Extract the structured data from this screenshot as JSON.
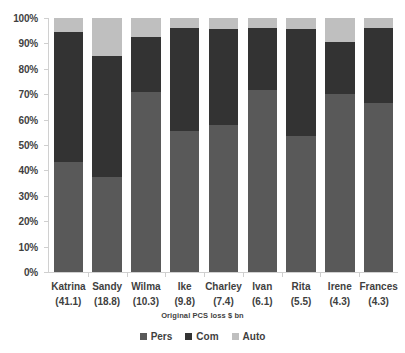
{
  "chart_data": {
    "type": "bar",
    "stacked": true,
    "normalized": true,
    "title": "",
    "subtitle": "",
    "xlabel": "Original PCS loss $ bn",
    "ylabel": "",
    "ylim": [
      0,
      100
    ],
    "y_tick_labels": [
      "0%",
      "10%",
      "20%",
      "30%",
      "40%",
      "50%",
      "60%",
      "70%",
      "80%",
      "90%",
      "100%"
    ],
    "y_tick_values": [
      0,
      10,
      20,
      30,
      40,
      50,
      60,
      70,
      80,
      90,
      100
    ],
    "grid": false,
    "legend_position": "bottom",
    "categories": [
      "Katrina",
      "Sandy",
      "Wilma",
      "Ike",
      "Charley",
      "Ivan",
      "Rita",
      "Irene",
      "Frances"
    ],
    "category_sublabels": [
      "(41.1)",
      "(18.8)",
      "(10.3)",
      "(9.8)",
      "(7.4)",
      "(6.1)",
      "(5.5)",
      "(4.3)",
      "(4.3)"
    ],
    "category_values": [
      41.1,
      18.8,
      10.3,
      9.8,
      7.4,
      6.1,
      5.5,
      4.3,
      4.3
    ],
    "series": [
      {
        "name": "Pers",
        "color": "#595959",
        "values": [
          43.5,
          37.5,
          71.0,
          55.5,
          58.0,
          71.5,
          53.5,
          70.0,
          66.5
        ]
      },
      {
        "name": "Com",
        "color": "#333333",
        "values": [
          51.0,
          47.5,
          21.5,
          40.5,
          37.5,
          24.5,
          42.0,
          20.5,
          29.5
        ]
      },
      {
        "name": "Auto",
        "color": "#bfbfbf",
        "values": [
          5.5,
          15.0,
          7.5,
          4.0,
          4.5,
          4.0,
          4.5,
          9.5,
          4.0
        ]
      }
    ],
    "axis_color": "#d0d0d0",
    "text_color": "#3f3f3f",
    "background": "#ffffff"
  }
}
